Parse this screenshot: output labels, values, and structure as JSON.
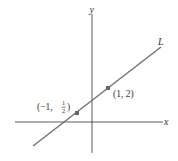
{
  "diagram": {
    "axes": {
      "x_label": "x",
      "y_label": "y"
    },
    "line": {
      "label": "L",
      "color": "#707070"
    },
    "points": [
      {
        "label_prefix": "(−1, ",
        "frac_num": "1",
        "frac_den": "2",
        "label_suffix": ")",
        "coords": [
          -1,
          0.5
        ]
      },
      {
        "label": "(1, 2)",
        "coords": [
          1,
          2
        ]
      }
    ],
    "colors": {
      "axis": "#333333",
      "line": "#707070",
      "point": "#666666"
    }
  }
}
